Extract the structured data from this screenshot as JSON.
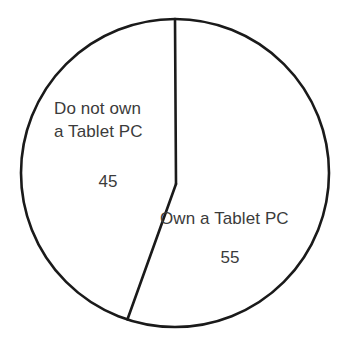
{
  "figure": {
    "name": "tablet-pc-ownership-pie-chart",
    "background_color": "#ffffff",
    "stroke_color": "#1a1a1a",
    "text_color": "#3b3b3b"
  },
  "chart_data": {
    "type": "pie",
    "title": "",
    "subtitle": "",
    "xlabel": "",
    "ylabel": "",
    "grid": false,
    "legend_position": "none",
    "labels_inside_slices": true,
    "total": 100,
    "units": "percent",
    "start_angle_deg": 0,
    "direction": "clockwise",
    "categories": [
      "Own a Tablet PC",
      "Do not own a Tablet PC"
    ],
    "values": [
      55,
      45
    ],
    "slices": [
      {
        "name": "Own a Tablet PC",
        "label_line1": "Own a Tablet PC",
        "value": 55,
        "value_text": "55",
        "start_angle_deg": 0,
        "end_angle_deg": 198,
        "fill": "#ffffff",
        "stroke": "#1a1a1a"
      },
      {
        "name": "Do not own a Tablet PC",
        "label_line1": "Do not own",
        "label_line2": "a Tablet PC",
        "value": 45,
        "value_text": "45",
        "start_angle_deg": 198,
        "end_angle_deg": 360,
        "fill": "#ffffff",
        "stroke": "#1a1a1a"
      }
    ],
    "geometry": {
      "center_x": 175,
      "center_y": 173,
      "radius": 154,
      "vertex_x": 176,
      "vertex_y": 184,
      "stroke_width": 2.6
    }
  }
}
